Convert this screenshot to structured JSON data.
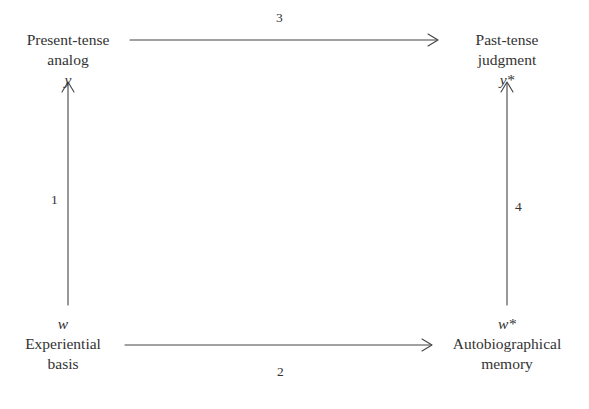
{
  "diagram": {
    "nodes": {
      "top_left": {
        "label_line1": "Present-tense",
        "label_line2": "analog",
        "variable": "y"
      },
      "top_right": {
        "label_line1": "Past-tense",
        "label_line2": "judgment",
        "variable": "y*"
      },
      "bottom_left": {
        "variable": "w",
        "label_line1": "Experiential",
        "label_line2": "basis"
      },
      "bottom_right": {
        "variable": "w*",
        "label_line1": "Autobiographical",
        "label_line2": "memory"
      }
    },
    "edges": [
      {
        "label": "1",
        "from": "Experiential basis (w)",
        "to": "Present-tense analog (y)"
      },
      {
        "label": "2",
        "from": "Experiential basis (w)",
        "to": "Autobiographical memory (w*)"
      },
      {
        "label": "3",
        "from": "Present-tense analog (y)",
        "to": "Past-tense judgment (y*)"
      },
      {
        "label": "4",
        "from": "Autobiographical memory (w*)",
        "to": "Past-tense judgment (y*)"
      }
    ],
    "colors": {
      "text": "#333333",
      "line": "#444444",
      "background": "#ffffff"
    }
  }
}
